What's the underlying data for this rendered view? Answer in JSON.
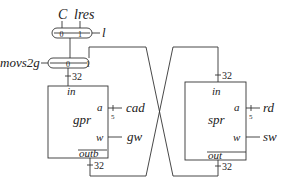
{
  "diagram": {
    "inputs": {
      "c": "C",
      "lres": "lres",
      "l": "l",
      "movs2g": "movs2g"
    },
    "mux_top": {
      "in0": "0",
      "in1": "1"
    },
    "mux_bottom": {
      "in0": "0",
      "in1": "1"
    },
    "gpr": {
      "name": "gpr",
      "port_in": "in",
      "port_a": "a",
      "port_w": "w",
      "port_out": "outb",
      "a_signal": "cad",
      "w_signal": "gw",
      "a_width": "5",
      "in_width": "32",
      "out_width": "32"
    },
    "spr": {
      "name": "spr",
      "port_in": "in",
      "port_a": "a",
      "port_w": "w",
      "port_out": "out",
      "a_signal": "rd",
      "w_signal": "sw",
      "a_width": "5",
      "in_width": "32",
      "out_width": "32"
    }
  }
}
